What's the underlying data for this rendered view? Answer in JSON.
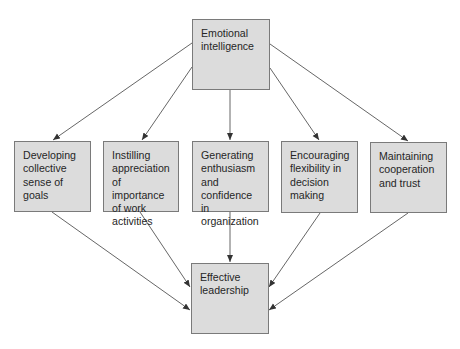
{
  "diagram": {
    "root": {
      "id": "emotional-intelligence",
      "label": "Emotional\nintelligence"
    },
    "mediators": [
      {
        "id": "collective-goals",
        "label": "Developing\ncollective\nsense of\ngoals"
      },
      {
        "id": "work-importance",
        "label": "Instilling\nappreciation\nof importance\nof work\nactivities"
      },
      {
        "id": "enthusiasm",
        "label": "Generating\nenthusiasm\nand\nconfidence in\norganization"
      },
      {
        "id": "flexibility",
        "label": "Encouraging\nflexibility in\ndecision\nmaking"
      },
      {
        "id": "cooperation",
        "label": "Maintaining\ncooperation\nand trust"
      }
    ],
    "outcome": {
      "id": "effective-leadership",
      "label": "Effective\nleadership"
    },
    "edges": [
      {
        "from": "emotional-intelligence",
        "to": "collective-goals"
      },
      {
        "from": "emotional-intelligence",
        "to": "work-importance"
      },
      {
        "from": "emotional-intelligence",
        "to": "enthusiasm"
      },
      {
        "from": "emotional-intelligence",
        "to": "flexibility"
      },
      {
        "from": "emotional-intelligence",
        "to": "cooperation"
      },
      {
        "from": "collective-goals",
        "to": "effective-leadership"
      },
      {
        "from": "work-importance",
        "to": "effective-leadership"
      },
      {
        "from": "enthusiasm",
        "to": "effective-leadership"
      },
      {
        "from": "flexibility",
        "to": "effective-leadership"
      },
      {
        "from": "cooperation",
        "to": "effective-leadership"
      }
    ],
    "colors": {
      "box_fill": "#dcdcdc",
      "box_border": "#7a7a7a",
      "line": "#555555",
      "text": "#262626"
    }
  }
}
